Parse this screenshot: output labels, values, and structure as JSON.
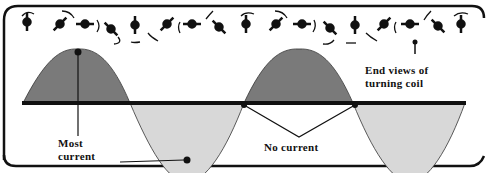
{
  "diagram": {
    "labels": {
      "most_current_line1": "Most",
      "most_current_line2": "current",
      "no_current": "No current",
      "end_views_line1": "End views of",
      "end_views_line2": "turning coil"
    },
    "colors": {
      "positive_fill": "#7a7a7a",
      "negative_fill": "#d8d8d8",
      "axis": "#111111",
      "frame": "#111111"
    },
    "coil_positions": [
      "vertical",
      "diagonal-right",
      "horizontal",
      "diagonal-left",
      "vertical",
      "diagonal-right",
      "horizontal",
      "diagonal-left",
      "vertical",
      "diagonal-right",
      "horizontal",
      "diagonal-left",
      "vertical",
      "diagonal-right",
      "horizontal",
      "diagonal-left",
      "vertical"
    ]
  }
}
